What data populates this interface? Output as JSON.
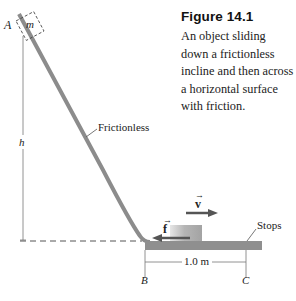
{
  "figure": {
    "title": "Figure 14.1",
    "caption": "An object sliding down a frictionless incline and then across a horizontal surface with friction."
  },
  "labels": {
    "point_a": "A",
    "mass": "m",
    "height": "h",
    "frictionless": "Frictionless",
    "velocity": "v",
    "friction": "f",
    "stops": "Stops",
    "distance": "1.0 m",
    "point_b": "B",
    "point_c": "C"
  },
  "colors": {
    "track": "#8c8c8c",
    "block": "#a6a6a6",
    "arrow": "#555555",
    "text": "#222222"
  }
}
